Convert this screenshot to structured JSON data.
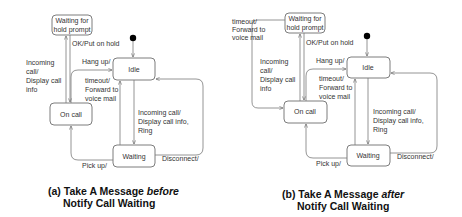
{
  "diagrams": [
    {
      "id": "a",
      "states": {
        "waiting_hold": [
          "Waiting for",
          "hold prompt"
        ],
        "idle": "Idle",
        "on_call": "On call",
        "waiting": "Waiting"
      },
      "transitions": {
        "ok_put_on_hold": "OK/Put on hold",
        "incoming_call_display": [
          "Incoming",
          "call/",
          "Display call",
          "info"
        ],
        "hang_up": "Hang up/",
        "timeout_forward": [
          "timeout/",
          "Forward to",
          "voice mail"
        ],
        "incoming_call_ring": [
          "Incoming call/",
          "Display call info,",
          "Ring"
        ],
        "pick_up": "Pick up/",
        "disconnect": "Disconnect/"
      },
      "caption": {
        "line1_prefix": "(a) Take A Message ",
        "line1_emph": "before",
        "line2": "Notify Call Waiting"
      }
    },
    {
      "id": "b",
      "states": {
        "waiting_hold": [
          "Waiting for",
          "hold prompt"
        ],
        "idle": "Idle",
        "on_call": "On call",
        "waiting": "Waiting"
      },
      "transitions": {
        "timeout_forward_top": [
          "timeout/",
          "Forward to",
          "voice mail"
        ],
        "ok_put_on_hold": "OK/Put on hold",
        "incoming_call_display": [
          "Incoming",
          "call/",
          "Display call",
          "info"
        ],
        "hang_up": "Hang up/",
        "timeout_forward": [
          "timeout/",
          "Forward to",
          "voice mail"
        ],
        "incoming_call_ring": [
          "Incoming call/",
          "Display call info,",
          "Ring"
        ],
        "pick_up": "Pick up/",
        "disconnect": "Disconnect/"
      },
      "caption": {
        "line1_prefix": "(b) Take A Message ",
        "line1_emph": "after",
        "line2": "Notify Call Waiting"
      }
    }
  ],
  "colors": {
    "line": "#7a7a7a",
    "state_border": "#6e6e6e",
    "initial_dot": "#000000",
    "text": "#333333"
  }
}
